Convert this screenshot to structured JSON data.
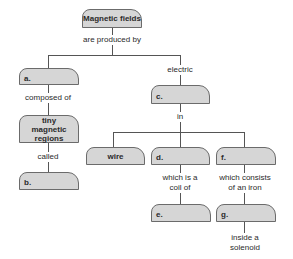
{
  "diagram": {
    "type": "concept-map",
    "colors": {
      "box_fill": "#d6d6d6",
      "box_border": "#6b6b6b",
      "line": "#555555",
      "text": "#2a2a2a"
    },
    "nodes": {
      "root": "Magnetic fields",
      "a": "a.",
      "tiny": "tiny magnetic regions",
      "b": "b.",
      "c": "c.",
      "wire": "wire",
      "d": "d.",
      "e": "e.",
      "f": "f.",
      "g": "g."
    },
    "links": {
      "produced_by": "are produced by",
      "composed_of": "composed of",
      "called": "called",
      "electric": "electric",
      "in": "in",
      "coil_of": "which is a coil of",
      "consists_of": "which consists of an iron",
      "inside": "inside a solenoid"
    }
  }
}
